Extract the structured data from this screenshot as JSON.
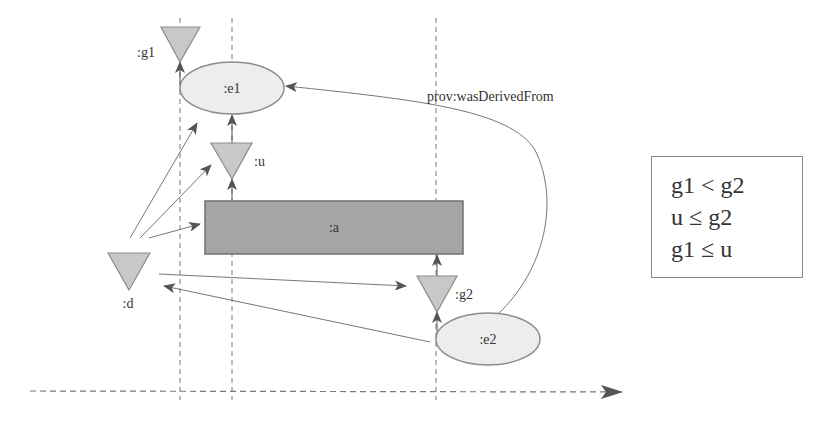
{
  "diagram": {
    "type": "provenance-timeline",
    "nodes": {
      "g1": {
        "label": ":g1",
        "shape": "triangle",
        "kind": "generation-event"
      },
      "e1": {
        "label": ":e1",
        "shape": "ellipse",
        "kind": "entity"
      },
      "u": {
        "label": ":u",
        "shape": "triangle",
        "kind": "usage-event"
      },
      "a": {
        "label": ":a",
        "shape": "rectangle",
        "kind": "activity"
      },
      "d": {
        "label": ":d",
        "shape": "triangle",
        "kind": "derivation-event"
      },
      "g2": {
        "label": ":g2",
        "shape": "triangle",
        "kind": "generation-event"
      },
      "e2": {
        "label": ":e2",
        "shape": "ellipse",
        "kind": "entity"
      }
    },
    "edges": [
      {
        "from": "g1",
        "to": "e1",
        "label": ""
      },
      {
        "from": "u",
        "to": "e1",
        "label": ""
      },
      {
        "from": "a",
        "to": "u",
        "label": ""
      },
      {
        "from": "g2",
        "to": "a",
        "label": ""
      },
      {
        "from": "e2",
        "to": "g2",
        "label": ""
      },
      {
        "from": "d",
        "to": "e1",
        "label": ""
      },
      {
        "from": "d",
        "to": "u",
        "label": ""
      },
      {
        "from": "d",
        "to": "a",
        "label": ""
      },
      {
        "from": "d",
        "to": "g2",
        "label": ""
      },
      {
        "from": "e2",
        "to": "d",
        "label": ""
      },
      {
        "from": "e2",
        "to": "e1",
        "label": "prov:wasDerivedFrom"
      }
    ],
    "edge_label": "prov:wasDerivedFrom",
    "timeline": {
      "direction": "left-to-right",
      "style": "dashed"
    },
    "colors": {
      "triangle_fill": "#c8c8c8",
      "triangle_stroke": "#8c8c8c",
      "ellipse_fill": "#ededed",
      "ellipse_stroke": "#8c8c8c",
      "activity_fill": "#a5a5a5",
      "activity_stroke": "#707070",
      "line": "#666666",
      "dash": "#777777"
    }
  },
  "constraints": {
    "lines": [
      "g1 < g2",
      "u ≤ g2",
      "g1 ≤ u"
    ]
  }
}
